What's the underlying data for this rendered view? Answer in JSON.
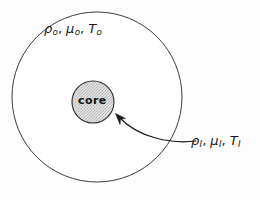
{
  "figure": {
    "type": "schematic-diagram",
    "background_color": "#fdfdfd",
    "stroke_color": "#1a1a1a",
    "core_fill_color": "#dcdcdc"
  },
  "outer_region": {
    "name": "outer-fluid-region",
    "label_symbols": [
      {
        "symbol": "ρ",
        "subscript": "o"
      },
      {
        "symbol": "μ",
        "subscript": "o"
      },
      {
        "symbol": "T",
        "subscript": "o"
      }
    ],
    "label_text": "ρo, μo, To",
    "shape": "circle",
    "center_x": 97,
    "center_y": 97,
    "radius": 85
  },
  "core_region": {
    "name": "core-region",
    "label": "core",
    "shape": "circle",
    "center_x": 93,
    "center_y": 102,
    "radius": 21,
    "fill": "stippled-gray"
  },
  "inner_region": {
    "name": "inner-core-properties",
    "label_symbols": [
      {
        "symbol": "ρ",
        "subscript": "I"
      },
      {
        "symbol": "μ",
        "subscript": "I"
      },
      {
        "symbol": "T",
        "subscript": "I"
      }
    ],
    "label_text": "ρI, μI, TI"
  },
  "annotation_arrow": {
    "name": "core-callout-arrow",
    "from_x": 196,
    "from_y": 141,
    "to_x": 116,
    "to_y": 113,
    "style": "curved-with-arrowhead"
  }
}
